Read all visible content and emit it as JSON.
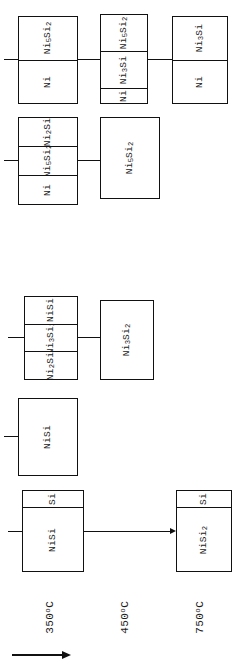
{
  "figure": {
    "orientation": "rotated-90-ccw",
    "line_color": "#111111",
    "background_color": "#ffffff",
    "axis_arrow_name": "temperature-axis-arrow"
  },
  "temperatures": [
    {
      "label": "350",
      "unit": "o",
      "scale": "C",
      "full": "350oC"
    },
    {
      "label": "450",
      "unit": "o",
      "scale": "C",
      "full": "450oC"
    },
    {
      "label": "750",
      "unit": "o",
      "scale": "C",
      "full": "750oC"
    }
  ],
  "sequences": [
    {
      "name": "sequence-ni5si2",
      "boxes": [
        {
          "name": "box-ni5si2-ni",
          "layers": [
            {
              "formula": "Ni",
              "sub1": "5",
              "mid": "Si",
              "sub2": "2",
              "text": "Ni5Si2"
            },
            {
              "formula": "Ni",
              "sub1": "",
              "mid": "",
              "sub2": "",
              "text": "Ni"
            }
          ]
        },
        {
          "name": "box-ni5si2-ni3si-ni",
          "layers": [
            {
              "text": "Ni5Si2"
            },
            {
              "text": "Ni3Si"
            },
            {
              "text": "Ni"
            }
          ]
        },
        {
          "name": "box-ni3si-ni",
          "layers": [
            {
              "text": "Ni3Si"
            },
            {
              "text": "Ni"
            }
          ]
        }
      ]
    },
    {
      "name": "sequence-ni2si",
      "boxes": [
        {
          "name": "box-ni2si-ni5si2-ni",
          "layers": [
            {
              "text": "Ni2Si"
            },
            {
              "text": "Ni5Si2"
            },
            {
              "text": "Ni"
            }
          ]
        },
        {
          "name": "box-ni5si2-single",
          "layers": [
            {
              "text": "Ni5Si2"
            }
          ]
        }
      ]
    },
    {
      "name": "sequence-nisi-ni3si2",
      "boxes": [
        {
          "name": "box-nisi-ni3si2-ni2si",
          "layers": [
            {
              "text": "NiSi"
            },
            {
              "text": "Ni3Si2"
            },
            {
              "text": "Ni2Si"
            }
          ]
        },
        {
          "name": "box-ni3si2-single",
          "layers": [
            {
              "text": "Ni3Si2"
            }
          ]
        }
      ]
    },
    {
      "name": "sequence-nisi-single",
      "boxes": [
        {
          "name": "box-nisi-single",
          "layers": [
            {
              "text": "NiSi"
            }
          ]
        }
      ]
    },
    {
      "name": "sequence-si-nisi",
      "boxes": [
        {
          "name": "box-si-nisi",
          "layers": [
            {
              "text": "Si"
            },
            {
              "text": "NiSi"
            }
          ]
        },
        {
          "name": "box-si-nisi2",
          "layers": [
            {
              "text": "Si"
            },
            {
              "text": "NiSi2"
            }
          ]
        }
      ]
    }
  ],
  "labels": {
    "r1b1l1": "Ni",
    "r1b1l1s": "5",
    "r1b1l1m": "Si",
    "r1b1l1s2": "2",
    "r1b1l2": "Ni",
    "r1b2l1": "Ni",
    "r1b2l1s": "5",
    "r1b2l1m": "Si",
    "r1b2l1s2": "2",
    "r1b2l2": "Ni",
    "r1b2l2s": "3",
    "r1b2l2m": "Si",
    "r1b2l3": "Ni",
    "r1b3l1": "Ni",
    "r1b3l1s": "3",
    "r1b3l1m": "Si",
    "r1b3l2": "Ni",
    "r2b1l1": "Ni",
    "r2b1l1s": "2",
    "r2b1l1m": "Si",
    "r2b1l2": "Ni",
    "r2b1l2s": "5",
    "r2b1l2m": "Si",
    "r2b1l2s2": "2",
    "r2b1l3": "Ni",
    "r2b2l1": "Ni",
    "r2b2l1s": "5",
    "r2b2l1m": "Si",
    "r2b2l1s2": "2",
    "r3b1l1": "NiSi",
    "r3b1l2": "Ni",
    "r3b1l2s": "3",
    "r3b1l2m": "Si",
    "r3b1l2s2": "2",
    "r3b1l3": "Ni",
    "r3b1l3s": "2",
    "r3b1l3m": "Si",
    "r3b2l1": "Ni",
    "r3b2l1s": "3",
    "r3b2l1m": "Si",
    "r3b2l1s2": "2",
    "r4b1l1": "NiSi",
    "r5b1l1": "Si",
    "r5b1l2": "NiSi",
    "r5b2l1": "Si",
    "r5b2l2": "NiSi",
    "r5b2l2s": "2",
    "temp1_num": "350",
    "temp1_deg": "o",
    "temp1_c": "C",
    "temp2_num": "450",
    "temp2_deg": "o",
    "temp2_c": "C",
    "temp3_num": "750",
    "temp3_deg": "o",
    "temp3_c": "C"
  }
}
